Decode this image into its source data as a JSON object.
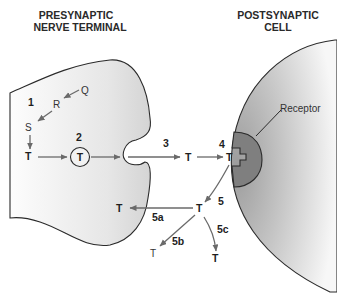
{
  "titles": {
    "presynaptic_line1": "PRESYNAPTIC",
    "presynaptic_line2": "NERVE TERMINAL",
    "postsynaptic_line1": "POSTSYNAPTIC",
    "postsynaptic_line2": "CELL"
  },
  "labels": {
    "receptor": "Receptor",
    "step1": "1",
    "step2": "2",
    "step3": "3",
    "step4": "4",
    "step5": "5",
    "step5a": "5a",
    "step5b": "5b",
    "step5c": "5c"
  },
  "molecules": {
    "Q": "Q",
    "R": "R",
    "S": "S",
    "T_synth": "T",
    "T_vesicle": "T",
    "T_cleft": "T",
    "T_bound": "T",
    "T_released": "T",
    "T_reuptake": "T",
    "T_5b": "T",
    "T_5c": "T"
  },
  "colors": {
    "presynaptic_fill_light": "#fbfbfb",
    "presynaptic_fill_dark": "#dcdcdc",
    "postsynaptic_fill_light": "#f4f4f4",
    "postsynaptic_fill_dark": "#a8a8a8",
    "receptor_fill": "#7d7d7d",
    "arrow": "#6a6a6a"
  }
}
